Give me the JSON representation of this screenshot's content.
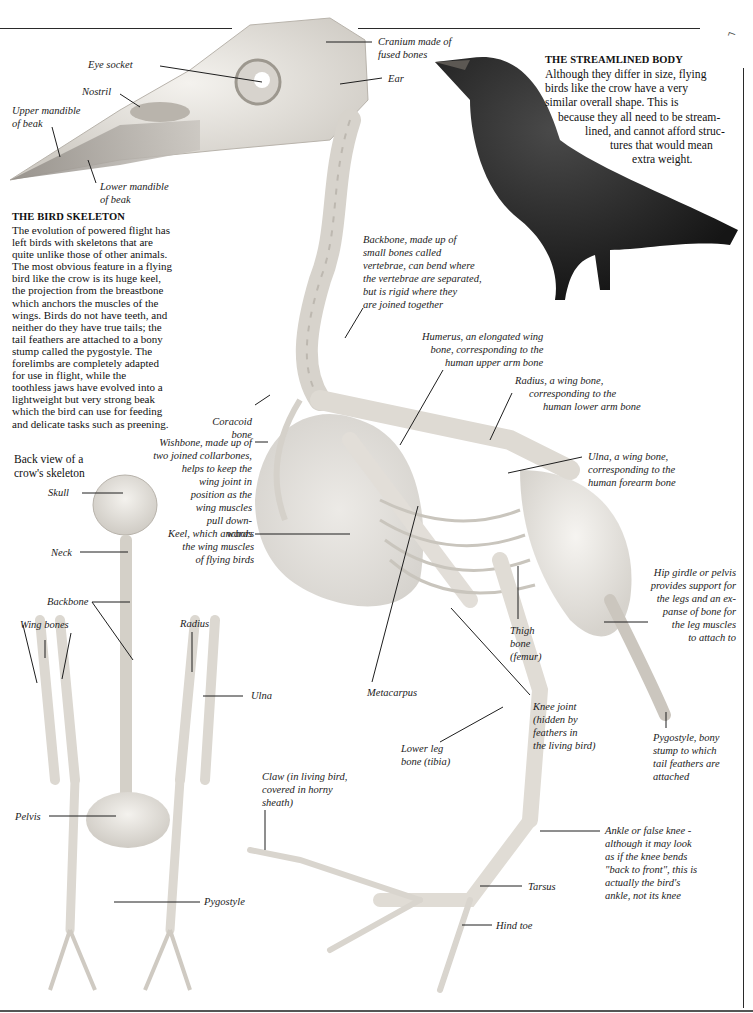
{
  "page": {
    "corner_mark": "⌐"
  },
  "intro": {
    "heading": "THE BIRD SKELETON",
    "lines": [
      "The evolution of powered flight has",
      "left birds with skeletons that are",
      "quite unlike those of other animals.",
      "The most obvious feature in a flying",
      "bird like the crow is its huge keel,",
      "the projection from the breastbone",
      "which anchors the muscles of the",
      "wings. Birds do not have teeth, and",
      "neither do they have true tails; the",
      "tail feathers are attached to a bony",
      "stump called the pygostyle. The",
      "forelimbs are completely adapted",
      "for use in flight, while the",
      "toothless jaws have evolved into a",
      "lightweight but very strong beak",
      "which the bird can use for feeding",
      "and delicate tasks such as preening."
    ]
  },
  "streamlined": {
    "heading": "THE STREAMLINED BODY",
    "lines": [
      "Although they differ in size, flying",
      "birds like the crow have a very",
      "similar overall shape. This is",
      "because they all need to be stream-",
      "lined, and cannot afford struc-",
      "tures that would mean",
      "extra weight."
    ]
  },
  "back_view": {
    "caption_lines": [
      "Back view of a",
      "crow's skeleton"
    ],
    "labels": {
      "skull": "Skull",
      "neck": "Neck",
      "backbone": "Backbone",
      "wing_bones": "Wing bones",
      "radius": "Radius",
      "ulna": "Ulna",
      "pelvis": "Pelvis",
      "pygostyle": "Pygostyle"
    }
  },
  "skull_labels": {
    "eye_socket": "Eye socket",
    "nostril": "Nostril",
    "upper_mandible": [
      "Upper mandible",
      "of beak"
    ],
    "lower_mandible": [
      "Lower mandible",
      "of beak"
    ],
    "cranium": [
      "Cranium made of",
      "fused bones"
    ],
    "ear": "Ear"
  },
  "side_labels": {
    "backbone": [
      "Backbone, made up of",
      "small bones called",
      "vertebrae, can bend where",
      "the vertebrae are separated,",
      "but is rigid where they",
      "are joined together"
    ],
    "humerus": [
      "Humerus, an elongated wing",
      "bone, corresponding to the",
      "human upper arm bone"
    ],
    "radius": [
      "Radius, a wing bone,",
      "corresponding to the",
      "human lower arm bone"
    ],
    "ulna": [
      "Ulna, a wing bone,",
      "corresponding to the",
      "human forearm bone"
    ],
    "coracoid": [
      "Coracoid",
      "bone"
    ],
    "wishbone": [
      "Wishbone, made up of",
      "two joined collarbones,",
      "helps to keep the",
      "wing joint in",
      "position as the",
      "wing muscles",
      "pull down-",
      "wards"
    ],
    "keel": [
      "Keel, which anchors",
      "the wing muscles",
      "of flying birds"
    ],
    "hip_girdle": [
      "Hip girdle or pelvis",
      "provides support for",
      "the legs and an ex-",
      "panse of bone for",
      "the leg muscles",
      "to attach to"
    ],
    "thigh": [
      "Thigh",
      "bone",
      "(femur)"
    ],
    "metacarpus": "Metacarpus",
    "knee": [
      "Knee joint",
      "(hidden by",
      "feathers in",
      "the living bird)"
    ],
    "lower_leg": [
      "Lower leg",
      "bone (tibia)"
    ],
    "pygostyle": [
      "Pygostyle, bony",
      "stump to which",
      "tail feathers are",
      "attached"
    ],
    "claw": [
      "Claw (in living bird,",
      "covered in horny",
      "sheath)"
    ],
    "ankle": [
      "Ankle or false knee -",
      "although it may look",
      "as if the knee bends",
      "\"back to front\", this is",
      "actually the bird's",
      "ankle, not its knee"
    ],
    "tarsus": "Tarsus",
    "hind_toe": "Hind toe"
  }
}
